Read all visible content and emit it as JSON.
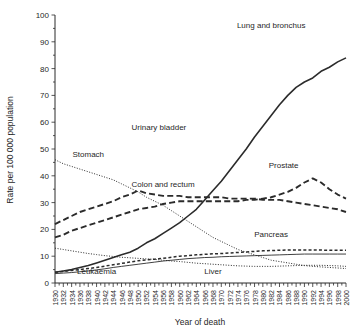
{
  "chart_data": {
    "type": "line",
    "title": "",
    "xlabel": "Year of death",
    "ylabel": "Rate per 100 000 population",
    "xlim": [
      1930,
      2000
    ],
    "ylim": [
      0,
      100
    ],
    "ytick_step": 10,
    "xtick_step": 2,
    "minor_xtick_step": 1,
    "grid": false,
    "legend_position": "inline-annotations",
    "yticks": [
      "0",
      "10",
      "20",
      "30",
      "40",
      "50",
      "60",
      "70",
      "80",
      "90",
      "100"
    ],
    "xticks": [
      "1930",
      "1932",
      "1934",
      "1936",
      "1938",
      "1940",
      "1942",
      "1944",
      "1946",
      "1948",
      "1950",
      "1952",
      "1954",
      "1956",
      "1958",
      "1960",
      "1962",
      "1964",
      "1966",
      "1968",
      "1970",
      "1972",
      "1974",
      "1976",
      "1978",
      "1980",
      "1982",
      "1984",
      "1986",
      "1988",
      "1990",
      "1992",
      "1994",
      "1996",
      "1998",
      "2000"
    ],
    "x": [
      1930,
      1932,
      1934,
      1936,
      1938,
      1940,
      1942,
      1944,
      1946,
      1948,
      1950,
      1952,
      1954,
      1956,
      1958,
      1960,
      1962,
      1964,
      1966,
      1968,
      1970,
      1972,
      1974,
      1976,
      1978,
      1980,
      1982,
      1984,
      1986,
      1988,
      1990,
      1992,
      1994,
      1996,
      1998,
      2000
    ],
    "series": [
      {
        "name": "Lung and bronchus",
        "label": "Lung and bronchus",
        "style": "solid-heavy",
        "label_x": 1982,
        "label_y": 95,
        "values": [
          4.0,
          4.5,
          5.0,
          5.8,
          6.5,
          7.5,
          8.5,
          9.5,
          10.5,
          11.5,
          13.0,
          15.0,
          16.5,
          18.5,
          20.5,
          22.5,
          25.0,
          27.5,
          31.0,
          34.5,
          38.0,
          42.0,
          46.0,
          50.0,
          54.5,
          58.5,
          62.5,
          66.5,
          70.0,
          73.0,
          75.0,
          76.5,
          79.0,
          80.5,
          82.5,
          84.0
        ]
      },
      {
        "name": "Stomach",
        "label": "Stomach",
        "style": "dotted",
        "label_x": 1938,
        "label_y": 47,
        "values": [
          46.0,
          44.5,
          43.5,
          42.5,
          41.5,
          40.5,
          39.5,
          38.5,
          37.0,
          35.5,
          34.0,
          32.0,
          30.5,
          29.0,
          27.0,
          25.0,
          23.0,
          21.0,
          19.0,
          17.0,
          15.5,
          14.0,
          12.5,
          11.5,
          10.5,
          9.5,
          8.5,
          8.0,
          7.5,
          7.0,
          6.5,
          6.2,
          6.0,
          5.8,
          5.6,
          5.4
        ]
      },
      {
        "name": "Colon and rectum",
        "label": "Colon and rectum",
        "style": "dashed-heavy",
        "label_x": 1956,
        "label_y": 36,
        "values": [
          22.0,
          23.5,
          25.0,
          26.5,
          27.5,
          28.5,
          29.5,
          30.5,
          32.0,
          33.0,
          34.5,
          33.5,
          33.0,
          32.5,
          32.5,
          32.5,
          32.0,
          32.0,
          32.0,
          32.0,
          32.0,
          31.5,
          31.5,
          31.5,
          31.5,
          31.0,
          31.0,
          31.0,
          30.5,
          30.0,
          29.5,
          29.0,
          28.5,
          28.0,
          27.5,
          26.5
        ]
      },
      {
        "name": "Prostate",
        "label": "Prostate",
        "style": "dashed-heavy",
        "label_x": 1985,
        "label_y": 43,
        "values": [
          17.0,
          18.0,
          19.5,
          20.5,
          21.5,
          22.5,
          23.5,
          24.5,
          25.5,
          26.5,
          27.5,
          28.0,
          28.5,
          29.5,
          30.0,
          30.5,
          30.5,
          30.5,
          30.5,
          30.5,
          30.5,
          30.5,
          30.5,
          31.0,
          31.0,
          31.5,
          32.0,
          33.0,
          34.0,
          35.5,
          37.5,
          39.0,
          37.5,
          35.0,
          33.0,
          31.5
        ]
      },
      {
        "name": "Pancreas",
        "label": "Pancreas",
        "style": "dashed-light",
        "label_x": 1982,
        "label_y": 17,
        "values": [
          4.0,
          4.3,
          4.7,
          5.0,
          5.4,
          5.8,
          6.3,
          6.8,
          7.3,
          7.8,
          8.3,
          8.6,
          8.9,
          9.2,
          9.6,
          10.0,
          10.2,
          10.5,
          10.7,
          10.9,
          11.0,
          11.2,
          11.4,
          11.6,
          11.8,
          12.0,
          12.1,
          12.2,
          12.3,
          12.3,
          12.3,
          12.3,
          12.3,
          12.2,
          12.2,
          12.2
        ]
      },
      {
        "name": "Leukaemia",
        "label": "Leukaemia",
        "style": "solid-light",
        "label_x": 1940,
        "label_y": 3.2,
        "values": [
          3.5,
          3.7,
          3.9,
          4.2,
          4.5,
          4.9,
          5.3,
          5.8,
          6.2,
          6.6,
          7.0,
          7.4,
          7.8,
          8.2,
          8.5,
          8.8,
          9.1,
          9.3,
          9.5,
          9.6,
          9.8,
          9.9,
          10.0,
          10.1,
          10.2,
          10.3,
          10.4,
          10.5,
          10.6,
          10.7,
          10.8,
          10.8,
          10.8,
          10.8,
          10.8,
          10.8
        ]
      },
      {
        "name": "Urinary bladder",
        "label": "Urinary bladder",
        "style": "dotted",
        "label_x": 1955,
        "label_y": 57,
        "values": [
          null,
          null,
          null,
          null,
          null,
          null,
          null,
          null,
          null,
          null,
          null,
          null,
          null,
          null,
          null,
          null,
          null,
          null,
          null,
          null,
          null,
          null,
          null,
          null,
          null,
          null,
          null,
          null,
          null,
          null,
          null,
          null,
          null,
          null,
          null,
          null
        ]
      },
      {
        "name": "Liver",
        "label": "Liver",
        "style": "dotted",
        "label_x": 1968,
        "label_y": 3.2,
        "values": [
          13.0,
          12.5,
          12.0,
          11.5,
          11.0,
          10.6,
          10.2,
          9.9,
          9.6,
          9.4,
          9.2,
          9.0,
          8.8,
          8.5,
          8.2,
          8.0,
          7.7,
          7.4,
          7.2,
          7.0,
          6.8,
          6.6,
          6.4,
          6.3,
          6.2,
          6.2,
          6.2,
          6.3,
          6.4,
          6.5,
          6.6,
          6.6,
          6.6,
          6.5,
          6.4,
          6.2
        ]
      }
    ],
    "annotations": [
      {
        "text": "Lung and bronchus",
        "x": 1982,
        "y": 95
      },
      {
        "text": "Urinary bladder",
        "x": 1955,
        "y": 57
      },
      {
        "text": "Stomach",
        "x": 1938,
        "y": 47
      },
      {
        "text": "Prostate",
        "x": 1985,
        "y": 43
      },
      {
        "text": "Colon and rectum",
        "x": 1956,
        "y": 36
      },
      {
        "text": "Pancreas",
        "x": 1982,
        "y": 17
      },
      {
        "text": "Leukaemia",
        "x": 1940,
        "y": 3.2
      },
      {
        "text": "Liver",
        "x": 1968,
        "y": 3.2
      }
    ]
  }
}
